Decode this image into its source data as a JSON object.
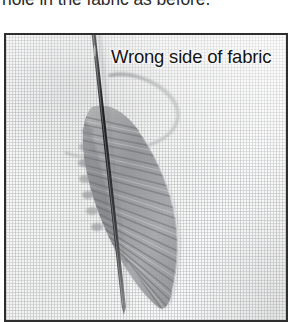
{
  "caption": {
    "text": "hole in the fabric as before."
  },
  "photo": {
    "label": "Wrong side of fabric",
    "alt_name": "embroidery-leaf-photo",
    "elements": {
      "needle": "sewing-needle",
      "thread": "thread-loop",
      "stitching": "satin-stitch-leaf"
    },
    "colors": {
      "border": "#2e2e2e",
      "fabric": "#f7f7f6",
      "weave": "#bcbec0",
      "thread": "#9a9c9e",
      "stitch": "#9b9d9f",
      "needle": "#2a2a2c",
      "label_text": "#141414"
    }
  }
}
